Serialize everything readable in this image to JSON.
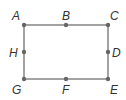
{
  "diagram": {
    "type": "rectangle-with-labeled-points",
    "colors": {
      "edge": "#8c8c8c",
      "point": "#666666",
      "label": "#333333",
      "background": "#ffffff"
    },
    "points": [
      {
        "id": "A",
        "label": "A",
        "x": 24,
        "y": 25,
        "role": "corner-top-left"
      },
      {
        "id": "B",
        "label": "B",
        "x": 66,
        "y": 25,
        "role": "midpoint-top"
      },
      {
        "id": "C",
        "label": "C",
        "x": 108,
        "y": 25,
        "role": "corner-top-right"
      },
      {
        "id": "D",
        "label": "D",
        "x": 108,
        "y": 52,
        "role": "midpoint-right"
      },
      {
        "id": "E",
        "label": "E",
        "x": 108,
        "y": 79,
        "role": "corner-bottom-right"
      },
      {
        "id": "F",
        "label": "F",
        "x": 66,
        "y": 79,
        "role": "midpoint-bottom"
      },
      {
        "id": "G",
        "label": "G",
        "x": 24,
        "y": 79,
        "role": "corner-bottom-left"
      },
      {
        "id": "H",
        "label": "H",
        "x": 24,
        "y": 52,
        "role": "midpoint-left"
      }
    ],
    "edges": [
      [
        "A",
        "C"
      ],
      [
        "C",
        "E"
      ],
      [
        "E",
        "G"
      ],
      [
        "G",
        "A"
      ]
    ]
  }
}
